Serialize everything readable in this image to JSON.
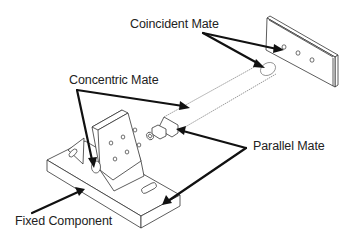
{
  "diagram": {
    "labels": {
      "coincident": "Coincident Mate",
      "concentric": "Concentric Mate",
      "parallel": "Parallel Mate",
      "fixed": "Fixed Component"
    },
    "parts": [
      {
        "name": "plate",
        "description": "rectangular plate with three holes"
      },
      {
        "name": "shaft",
        "description": "cylindrical shaft with stepped end"
      },
      {
        "name": "bracket",
        "description": "angle bracket with hole pattern and slots"
      }
    ],
    "colors": {
      "line": "#333333",
      "arrow": "#111111",
      "text": "#222222",
      "background": "#ffffff"
    }
  }
}
